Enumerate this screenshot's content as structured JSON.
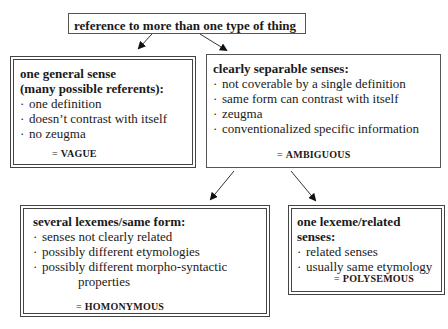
{
  "root": {
    "label": "reference to more than one type of thing"
  },
  "vague": {
    "title_line1": "one general sense",
    "title_line2": "(many possible referents):",
    "items": [
      "one definition",
      "doesn’t contrast with itself",
      "no zeugma"
    ],
    "result": "VAGUE"
  },
  "ambiguous": {
    "title": "clearly separable senses:",
    "items": [
      "not coverable by a single definition",
      "same form can contrast with itself",
      "zeugma",
      "conventionalized specific information"
    ],
    "result": "AMBIGUOUS"
  },
  "homonymous": {
    "title": "several lexemes/same form:",
    "items": [
      "senses not clearly related",
      "possibly different etymologies",
      "possibly different morpho-syntactic"
    ],
    "continuation": "properties",
    "result": "HOMONYMOUS"
  },
  "polysemous": {
    "title": "one lexeme/related senses:",
    "items": [
      "related senses",
      "usually same etymology"
    ],
    "result": "POLYSEMOUS"
  },
  "symbols": {
    "bullet": "·",
    "equals": "="
  }
}
